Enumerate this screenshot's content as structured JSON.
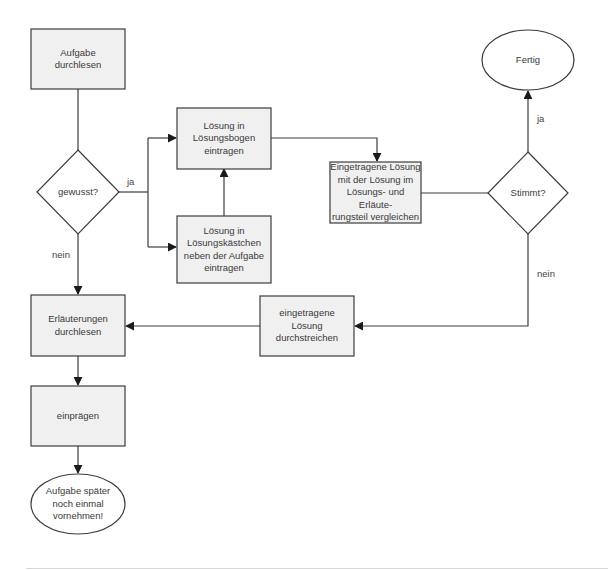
{
  "colors": {
    "box_fill": "#f0f0f0",
    "stroke": "#3c3c3c",
    "text": "#3a3a3a",
    "background": "#ffffff"
  },
  "nodes": {
    "read_task": {
      "shape": "rect",
      "label": "Aufgabe\ndurchlesen"
    },
    "known": {
      "shape": "diamond",
      "label": "gewusst?"
    },
    "enter_answer_sheet": {
      "shape": "rect",
      "label": "Lösung in\nLösungsbogen\neintragen"
    },
    "enter_answer_box": {
      "shape": "rect",
      "label": "Lösung in\nLösungskästchen\nneben der Aufgabe\neintragen"
    },
    "compare": {
      "shape": "rect",
      "label": "Eingetragene Lösung\nmit der Lösung im\nLösungs- und Erläute-\nrungsteil vergleichen"
    },
    "correct": {
      "shape": "diamond",
      "label": "Stimmt?"
    },
    "done": {
      "shape": "ellipse",
      "label": "Fertig"
    },
    "read_explanations": {
      "shape": "rect",
      "label": "Erläuterungen\ndurchlesen"
    },
    "strike_answer": {
      "shape": "rect",
      "label": "eingetragene\nLösung\ndurchstreichen"
    },
    "memorize": {
      "shape": "rect",
      "label": "einprägen"
    },
    "redo_later": {
      "shape": "ellipse",
      "label": "Aufgabe später\nnoch einmal\nvornehmen!"
    }
  },
  "edge_labels": {
    "known_yes": "ja",
    "known_no": "nein",
    "correct_yes": "ja",
    "correct_no": "nein"
  },
  "edges": [
    {
      "from": "read_task",
      "to": "known"
    },
    {
      "from": "known",
      "to": "enter_answer_sheet",
      "label": "ja"
    },
    {
      "from": "known",
      "to": "enter_answer_box",
      "label": "ja"
    },
    {
      "from": "enter_answer_box",
      "to": "enter_answer_sheet"
    },
    {
      "from": "enter_answer_sheet",
      "to": "compare"
    },
    {
      "from": "compare",
      "to": "correct"
    },
    {
      "from": "correct",
      "to": "done",
      "label": "ja"
    },
    {
      "from": "correct",
      "to": "strike_answer",
      "label": "nein"
    },
    {
      "from": "strike_answer",
      "to": "read_explanations"
    },
    {
      "from": "known",
      "to": "read_explanations",
      "label": "nein"
    },
    {
      "from": "read_explanations",
      "to": "memorize"
    },
    {
      "from": "memorize",
      "to": "redo_later"
    }
  ]
}
